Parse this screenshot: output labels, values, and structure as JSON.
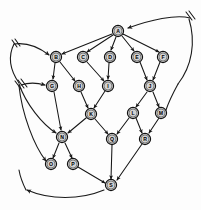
{
  "figure": {
    "kind": "directed-graph",
    "title": "",
    "background_color": "#fdfdfd",
    "node_fill_color": "#d2d2d2",
    "node_stroke_color": "#111111",
    "edge_color": "#161616",
    "node_radius": 5.6,
    "width": 201,
    "height": 210
  },
  "nodes": [
    {
      "id": "A",
      "label": "A",
      "x": 118,
      "y": 31
    },
    {
      "id": "B",
      "label": "B",
      "x": 56,
      "y": 57
    },
    {
      "id": "C",
      "label": "C",
      "x": 83,
      "y": 57
    },
    {
      "id": "D",
      "label": "D",
      "x": 110,
      "y": 57
    },
    {
      "id": "E",
      "label": "E",
      "x": 137,
      "y": 57
    },
    {
      "id": "F",
      "label": "F",
      "x": 163,
      "y": 57
    },
    {
      "id": "G",
      "label": "G",
      "x": 52,
      "y": 86
    },
    {
      "id": "H",
      "label": "H",
      "x": 79,
      "y": 86
    },
    {
      "id": "I",
      "label": "I",
      "x": 108,
      "y": 86
    },
    {
      "id": "J",
      "label": "J",
      "x": 150,
      "y": 86
    },
    {
      "id": "K",
      "label": "K",
      "x": 91,
      "y": 114
    },
    {
      "id": "L",
      "label": "L",
      "x": 133,
      "y": 113
    },
    {
      "id": "M",
      "label": "M",
      "x": 161,
      "y": 113
    },
    {
      "id": "N",
      "label": "N",
      "x": 62,
      "y": 137
    },
    {
      "id": "Q",
      "label": "Q",
      "x": 112,
      "y": 139
    },
    {
      "id": "R",
      "label": "R",
      "x": 145,
      "y": 139
    },
    {
      "id": "O",
      "label": "O",
      "x": 51,
      "y": 164
    },
    {
      "id": "P",
      "label": "P",
      "x": 73,
      "y": 164
    },
    {
      "id": "S",
      "label": "S",
      "x": 111,
      "y": 185
    }
  ],
  "edges": [
    {
      "from": "A",
      "to": "B",
      "kind": "straight"
    },
    {
      "from": "A",
      "to": "C",
      "kind": "straight"
    },
    {
      "from": "A",
      "to": "D",
      "kind": "straight"
    },
    {
      "from": "A",
      "to": "E",
      "kind": "straight"
    },
    {
      "from": "A",
      "to": "F",
      "kind": "straight"
    },
    {
      "from": "B",
      "to": "G",
      "kind": "straight"
    },
    {
      "from": "B",
      "to": "H",
      "kind": "straight"
    },
    {
      "from": "C",
      "to": "I",
      "kind": "straight"
    },
    {
      "from": "D",
      "to": "I",
      "kind": "straight"
    },
    {
      "from": "E",
      "to": "J",
      "kind": "straight"
    },
    {
      "from": "F",
      "to": "J",
      "kind": "straight"
    },
    {
      "from": "G",
      "to": "N",
      "kind": "straight"
    },
    {
      "from": "H",
      "to": "K",
      "kind": "straight"
    },
    {
      "from": "I",
      "to": "K",
      "kind": "straight"
    },
    {
      "from": "J",
      "to": "L",
      "kind": "straight"
    },
    {
      "from": "J",
      "to": "M",
      "kind": "straight"
    },
    {
      "from": "K",
      "to": "N",
      "kind": "straight"
    },
    {
      "from": "K",
      "to": "Q",
      "kind": "straight"
    },
    {
      "from": "L",
      "to": "Q",
      "kind": "straight"
    },
    {
      "from": "L",
      "to": "R",
      "kind": "straight"
    },
    {
      "from": "M",
      "to": "R",
      "kind": "straight"
    },
    {
      "from": "N",
      "to": "O",
      "kind": "straight"
    },
    {
      "from": "N",
      "to": "P",
      "kind": "straight"
    },
    {
      "from": "Q",
      "to": "S",
      "kind": "straight"
    },
    {
      "from": "R",
      "to": "S",
      "kind": "straight"
    },
    {
      "from": "P",
      "to": "S",
      "kind": "straight"
    }
  ],
  "long_edges": [
    {
      "name": "edge-left-to-b",
      "to": "B",
      "tick_marks": 2,
      "description": "long back edge entering B from upper left"
    },
    {
      "name": "edge-left-to-g",
      "to": "G",
      "tick_marks": 3,
      "description": "long back edge entering G from left"
    },
    {
      "name": "edge-right-to-a",
      "to": "A",
      "tick_marks": 2,
      "description": "long curved back edge entering A from the right"
    },
    {
      "name": "edge-s-to-lower-left",
      "from": "S",
      "tick_marks": 0,
      "description": "long curve from S sweeping to lower left"
    },
    {
      "name": "edge-lower-left-to-n",
      "to": "N",
      "tick_marks": 0,
      "description": "curve from lower left up to N"
    },
    {
      "name": "edge-lower-left-to-o",
      "to": "O",
      "tick_marks": 0,
      "description": "curve from lower left up to O"
    }
  ]
}
